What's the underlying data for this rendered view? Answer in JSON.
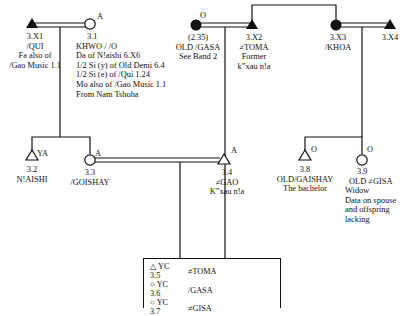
{
  "people": {
    "x1": {
      "id": "3.X1",
      "name": "/QUI",
      "notes": [
        "Fa also of",
        "/Gao Music 1.1"
      ]
    },
    "p31": {
      "tag": "A",
      "id": "3.1",
      "name": "KHWO / /O",
      "notes": [
        "Da of N!aishi 6.X6",
        "1/2 Si (y) of Old Demi 6.4",
        "1/2 Si (e) of /Qui 1.24",
        "Mo also of /Gao Music 1.1",
        "From Nam Tshoha"
      ]
    },
    "gasa": {
      "tag": "O",
      "id": "(2.35)",
      "name": "OLD /GASA",
      "notes": [
        "See Band 2"
      ]
    },
    "x2": {
      "id": "3.X2",
      "name": "≠TOMA",
      "notes": [
        "Former",
        "k”xau n!a"
      ]
    },
    "x3": {
      "id": "3.X3",
      "name": "/KHOA"
    },
    "x4": {
      "id": "3.X4"
    },
    "p32": {
      "tag": "YA",
      "id": "3.2",
      "name": "N!AISHI"
    },
    "p33": {
      "tag": "A",
      "id": "3.3",
      "name": "/GOISHAY"
    },
    "p34": {
      "tag": "A",
      "id": "3.4",
      "name": "≠GAO",
      "notes": [
        "K”xau n!a"
      ]
    },
    "p38": {
      "tag": "O",
      "id": "3.8",
      "name": "OLD/GAISHAY",
      "notes": [
        "The bachelor"
      ]
    },
    "p39": {
      "tag": "O",
      "id": "3.9",
      "name": "OLD ≠GISA",
      "notes": [
        "Widow",
        "Data on spouse",
        "and offspring",
        "lacking"
      ]
    }
  },
  "children_box": {
    "rows": [
      {
        "symbol": "△",
        "tag": "YC",
        "id": "3.5",
        "name": "≠TOMA"
      },
      {
        "symbol": "○",
        "tag": "YC",
        "id": "3.6",
        "name": "/GASA"
      },
      {
        "symbol": "○",
        "tag": "YC",
        "id": "3.7",
        "name": "≠GISA"
      }
    ]
  }
}
